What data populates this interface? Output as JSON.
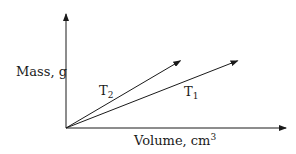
{
  "chart_data": {
    "type": "line",
    "title": "",
    "xlabel": "Volume, cm³",
    "ylabel": "Mass, g",
    "xlim": [
      0,
      1
    ],
    "ylim": [
      0,
      1
    ],
    "grid": false,
    "ticks": "none",
    "series": [
      {
        "name": "T₂",
        "base": "T",
        "sub": "2",
        "x": [
          0,
          0.52
        ],
        "y": [
          0,
          0.59
        ],
        "arrow": true
      },
      {
        "name": "T₁",
        "base": "T",
        "sub": "1",
        "x": [
          0,
          0.78
        ],
        "y": [
          0,
          0.59
        ],
        "arrow": true
      }
    ],
    "note": "Qualitative graph: straight lines through origin; T₂ has the steeper slope (higher density) than T₁. No numeric tick values shown."
  },
  "labels": {
    "ylabel": "Mass, g",
    "xlabel_text": "Volume, cm",
    "xlabel_sup": "3",
    "t2_base": "T",
    "t2_sub": "2",
    "t1_base": "T",
    "t1_sub": "1"
  },
  "colors": {
    "ink": "#1a1a1a"
  }
}
